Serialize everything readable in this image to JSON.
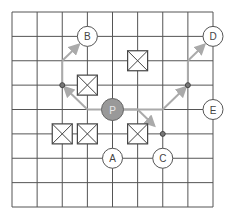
{
  "grid": {
    "cols": 8,
    "rows": 8,
    "x0": 12,
    "y0": 12,
    "x1": 213,
    "y1": 207,
    "line_color": "#555555"
  },
  "colors": {
    "path": "#aaaaaa",
    "player_fill": "#999999",
    "player_stroke": "#666666",
    "node_stroke": "#555555",
    "node_fill": "#ffffff"
  },
  "player": {
    "label": "P",
    "col": 4,
    "row": 4
  },
  "targets": [
    {
      "label": "A",
      "col": 4,
      "row": 6
    },
    {
      "label": "B",
      "col": 3,
      "row": 1
    },
    {
      "label": "C",
      "col": 6,
      "row": 6
    },
    {
      "label": "D",
      "col": 8,
      "row": 1
    },
    {
      "label": "E",
      "col": 8,
      "row": 4
    }
  ],
  "obstacles": [
    {
      "name": "obstacle-1",
      "col": 3,
      "row": 3,
      "note": "box between cols 2.6-3.4, rows 2.6-3.4"
    },
    {
      "name": "obstacle-2",
      "col": 5,
      "row": 2
    },
    {
      "name": "obstacle-3",
      "col": 2,
      "row": 5
    },
    {
      "name": "obstacle-4",
      "col": 3,
      "row": 5
    },
    {
      "name": "obstacle-5",
      "col": 5,
      "row": 5
    }
  ],
  "waypoints": [
    {
      "col": 2,
      "row": 3
    },
    {
      "col": 7,
      "row": 3
    },
    {
      "col": 6,
      "row": 5
    }
  ],
  "paths": [
    {
      "name": "path-to-b",
      "points": [
        [
          4,
          4
        ],
        [
          3,
          4
        ],
        [
          2,
          3
        ],
        [
          2,
          2
        ],
        [
          3,
          1
        ]
      ],
      "arrows_at": [
        2,
        4
      ]
    },
    {
      "name": "path-to-d",
      "points": [
        [
          4,
          4
        ],
        [
          6,
          4
        ],
        [
          7,
          3
        ],
        [
          7,
          2
        ],
        [
          8,
          1
        ]
      ],
      "arrows_at": [
        2,
        4
      ]
    },
    {
      "name": "path-to-c",
      "points": [
        [
          4,
          4
        ],
        [
          5,
          4
        ],
        [
          6,
          5
        ]
      ],
      "arrows_at": [
        2
      ]
    }
  ]
}
